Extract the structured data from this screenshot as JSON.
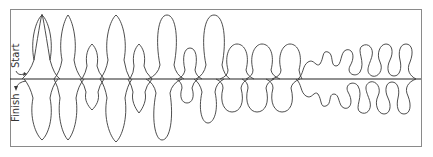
{
  "diagram": {
    "type": "quilting-motif-stitch-path",
    "labels": {
      "start": "Start",
      "finish": "Finish"
    },
    "frame": {
      "x": 10,
      "y": 9,
      "width": 411,
      "height": 137
    },
    "centerline_y": 79,
    "colors": {
      "stroke": "#3a3a3a",
      "frame": "#8a8a8a",
      "background": "#ffffff"
    },
    "sections": [
      {
        "name": "pointed-leaves",
        "description": "Pointed leaf (teardrop) shapes above and below the line",
        "count_top": 5,
        "count_bottom": 5
      },
      {
        "name": "elongated-loops",
        "description": "Tall oval loops alternating sizes",
        "count_top": 3,
        "count_bottom": 3
      },
      {
        "name": "round-loops",
        "description": "Round loops of equal size",
        "count_top": 3,
        "count_bottom": 3
      },
      {
        "name": "wavy-meander",
        "description": "Wavy meander tightening into S-curve loops",
        "count_top": 1,
        "count_bottom": 1
      }
    ]
  }
}
